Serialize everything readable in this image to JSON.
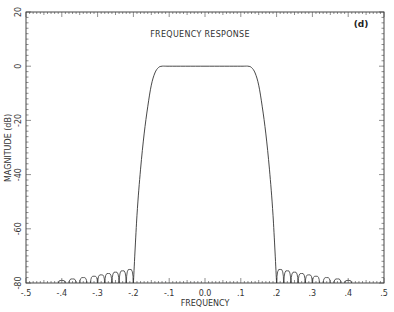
{
  "chart_data": {
    "type": "line",
    "title": "FREQUENCY RESPONSE",
    "panel_label": "(d)",
    "xlabel": "FREQUENCY",
    "ylabel": "MAGNITUDE (dB)",
    "xlim": [
      -0.5,
      0.5
    ],
    "ylim": [
      -80,
      20
    ],
    "xticks": [
      -0.5,
      -0.4,
      -0.3,
      -0.2,
      -0.1,
      0.0,
      0.1,
      0.2,
      0.3,
      0.4,
      0.5
    ],
    "xtick_labels": [
      "-.5",
      "-.4",
      "-.3",
      "-.2",
      "-.1",
      "0.0",
      ".1",
      ".2",
      ".3",
      ".4",
      ".5"
    ],
    "yticks": [
      20,
      0,
      -20,
      -40,
      -60,
      -80
    ],
    "ytick_labels": [
      "20",
      "0",
      "-20",
      "-40",
      "-60",
      "-80"
    ],
    "grid": false,
    "series": [
      {
        "name": "magnitude",
        "passband_db": 0,
        "passband_edges": [
          -0.13,
          0.13
        ],
        "stopband_edges": [
          -0.2,
          0.2
        ],
        "x": [
          -0.2,
          -0.19,
          -0.18,
          -0.17,
          -0.16,
          -0.15,
          -0.14,
          -0.13,
          -0.12,
          -0.1,
          0.0,
          0.1,
          0.12,
          0.13,
          0.14,
          0.15,
          0.16,
          0.17,
          0.18,
          0.19,
          0.2
        ],
        "y": [
          -80,
          -55,
          -38,
          -25,
          -15,
          -7,
          -2.5,
          -0.5,
          0,
          0,
          0,
          0,
          0,
          -0.5,
          -2.5,
          -7,
          -15,
          -25,
          -38,
          -55,
          -80
        ],
        "sidelobe_peaks": [
          {
            "x": -0.21,
            "y": -75
          },
          {
            "x": -0.23,
            "y": -75.5
          },
          {
            "x": -0.25,
            "y": -76
          },
          {
            "x": -0.27,
            "y": -76.5
          },
          {
            "x": -0.29,
            "y": -77
          },
          {
            "x": -0.31,
            "y": -77.5
          },
          {
            "x": -0.34,
            "y": -78
          },
          {
            "x": -0.37,
            "y": -78.5
          },
          {
            "x": -0.4,
            "y": -79
          },
          {
            "x": 0.21,
            "y": -75
          },
          {
            "x": 0.23,
            "y": -75.5
          },
          {
            "x": 0.25,
            "y": -76
          },
          {
            "x": 0.27,
            "y": -76.5
          },
          {
            "x": 0.29,
            "y": -77
          },
          {
            "x": 0.31,
            "y": -77.5
          },
          {
            "x": 0.34,
            "y": -78
          },
          {
            "x": 0.37,
            "y": -78.5
          },
          {
            "x": 0.4,
            "y": -79
          }
        ]
      }
    ]
  }
}
